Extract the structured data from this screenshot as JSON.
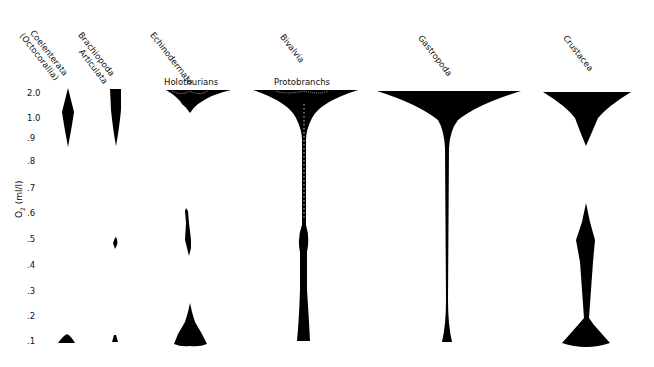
{
  "figure": {
    "y_axis": {
      "label_main": "O",
      "label_sub": "2",
      "label_unit": " (ml/l)",
      "ticks": [
        "2.0",
        "1.0",
        ".9",
        ".8",
        ".7",
        ".6",
        ".5",
        ".4",
        ".3",
        ".2",
        ".1"
      ]
    },
    "taxa": [
      {
        "name_line1": "Coelenterata",
        "name_line2": "(Octocorallia)"
      },
      {
        "name_line1": "Brachiopoda",
        "name_line2": "Articulata"
      },
      {
        "name_line1": "Echinodermata",
        "name_line2": ""
      },
      {
        "name_line1": "Bivalvia",
        "name_line2": ""
      },
      {
        "name_line1": "Gastropoda",
        "name_line2": ""
      },
      {
        "name_line1": "Crustacea",
        "name_line2": ""
      }
    ],
    "subgroups": [
      {
        "label": "Holothurians",
        "taxon": "Echinodermata"
      },
      {
        "label": "Protobranchs",
        "taxon": "Bivalvia"
      }
    ],
    "colors": {
      "ink": "#000000",
      "background": "#ffffff"
    }
  }
}
